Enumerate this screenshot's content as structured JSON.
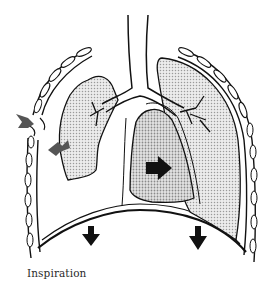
{
  "figure": {
    "caption": "Inspiration",
    "colors": {
      "outline": "#111111",
      "lung_fill": "#d9d9d9",
      "heart_fill": "#c9c9c9",
      "arrow_dark": "#111111",
      "arrow_grey": "#555555",
      "background": "#ffffff"
    },
    "elements": [
      {
        "name": "trachea"
      },
      {
        "name": "left-collapsed-lung"
      },
      {
        "name": "right-lung"
      },
      {
        "name": "heart-mediastinum"
      },
      {
        "name": "diaphragm"
      },
      {
        "name": "ribs-left"
      },
      {
        "name": "ribs-right"
      },
      {
        "name": "chest-wound-opening"
      }
    ],
    "arrows": [
      {
        "name": "air-entry-arrow",
        "direction": "inward-right",
        "color": "grey"
      },
      {
        "name": "air-into-pleural-space-arrow",
        "direction": "down-left",
        "color": "grey"
      },
      {
        "name": "mediastinal-shift-arrow",
        "direction": "right",
        "color": "black"
      },
      {
        "name": "diaphragm-down-arrow-left",
        "direction": "down",
        "color": "black"
      },
      {
        "name": "diaphragm-down-arrow-right",
        "direction": "down",
        "color": "black"
      }
    ]
  }
}
